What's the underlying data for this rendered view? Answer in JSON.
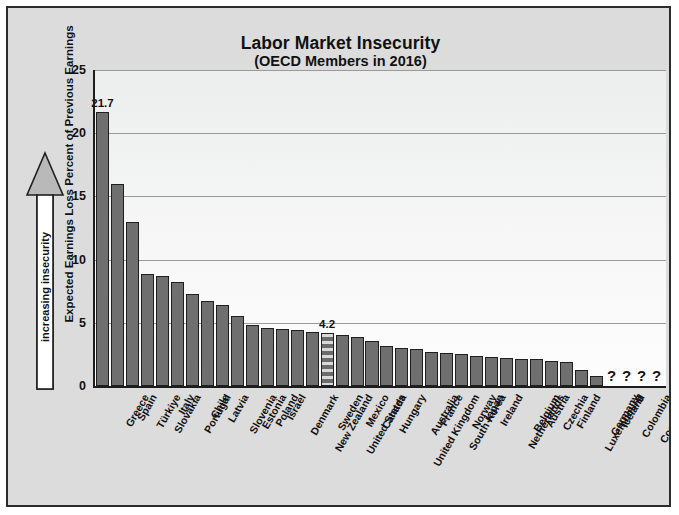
{
  "chart_data": {
    "type": "bar",
    "title": "Labor Market Insecurity",
    "subtitle": "(OECD Members in 2016)",
    "xlabel": "",
    "ylabel": "Expected Earnings Loss Percent of Previous Earnings",
    "ylim": [
      0,
      25
    ],
    "yticks": [
      0,
      5,
      10,
      15,
      20,
      25
    ],
    "grid": true,
    "legend": "none",
    "annotations": [
      {
        "name": "increasing-insecurity-arrow",
        "text": "increasing insecurity",
        "direction": "up"
      },
      {
        "name": "max-bar-value-label",
        "text": "21.7",
        "category": "Greece"
      },
      {
        "name": "highlight-bar-value-label",
        "text": "4.2",
        "category": "United States"
      }
    ],
    "highlight_category": "United States",
    "no_data_marker": "?",
    "categories": [
      "Greece",
      "Spain",
      "Türkiye",
      "Slovakia",
      "Italy",
      "Portugal",
      "Chile",
      "Latvia",
      "Slovenia",
      "Estonia",
      "Poland",
      "Israel",
      "Denmark",
      "New Zealand",
      "Sweden",
      "United States",
      "Mexico",
      "Canada",
      "Hungary",
      "United Kingdom",
      "Australia",
      "France",
      "South Korea",
      "Norway",
      "Japan",
      "Ireland",
      "Netherlands",
      "Belgium",
      "Austria",
      "Czechia",
      "Finland",
      "Luxembourg",
      "Germany",
      "Iceland",
      "Colombia",
      "Costa Rica",
      "Lithuania",
      "Switzerland"
    ],
    "values": [
      21.7,
      16.0,
      13.0,
      8.9,
      8.7,
      8.2,
      7.3,
      6.7,
      6.4,
      5.5,
      4.8,
      4.6,
      4.5,
      4.4,
      4.3,
      4.2,
      4.0,
      3.9,
      3.6,
      3.2,
      3.0,
      2.9,
      2.7,
      2.6,
      2.5,
      2.4,
      2.3,
      2.2,
      2.1,
      2.1,
      2.0,
      1.9,
      1.3,
      0.8,
      null,
      null,
      null,
      null
    ]
  },
  "colors": {
    "bar_fill": "#6f6f6f",
    "bar_outline": "#1f1f1f",
    "highlight_light": "#d9d9d9",
    "figure_background": "#dcdcdc",
    "plot_background": "#f5f5f5",
    "gridline": "#9a9a9a",
    "text": "#111111"
  }
}
